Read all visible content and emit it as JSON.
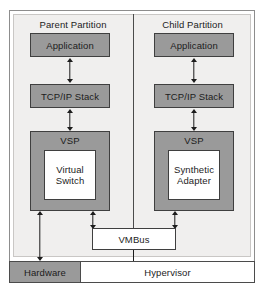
{
  "diagram": {
    "type": "block-diagram",
    "colors": {
      "component_fill": "#9a9a9a",
      "component_border": "#3f3f3f",
      "inner_fill": "#ffffff",
      "panel_background": "#f0efee",
      "frame_border": "#8d8d8d",
      "connector": "#1c1c1c"
    }
  },
  "partitions": [
    {
      "caption": "Parent Partition",
      "components": [
        {
          "label": "Application",
          "style": "gray"
        },
        {
          "label": "TCP/IP Stack",
          "style": "gray"
        },
        {
          "label": "VSP",
          "style": "gray",
          "inner": {
            "label": "Virtual\nSwitch",
            "line1": "Virtual",
            "line2": "Switch",
            "style": "white"
          }
        }
      ]
    },
    {
      "caption": "Child Partition",
      "components": [
        {
          "label": "Application",
          "style": "gray"
        },
        {
          "label": "TCP/IP Stack",
          "style": "gray"
        },
        {
          "label": "VSP",
          "style": "gray",
          "inner": {
            "label": "Synthetic\nAdapter",
            "line1": "Synthetic",
            "line2": "Adapter",
            "style": "white"
          }
        }
      ]
    }
  ],
  "bus": {
    "label": "VMBus",
    "style": "white"
  },
  "platform": [
    {
      "label": "Hardware",
      "style": "gray"
    },
    {
      "label": "Hypervisor",
      "style": "white"
    }
  ],
  "connectors": [
    {
      "from": "Parent Application",
      "to": "Parent TCP/IP Stack",
      "arrows": "both"
    },
    {
      "from": "Parent TCP/IP Stack",
      "to": "Parent VSP",
      "arrows": "both"
    },
    {
      "from": "Parent VSP",
      "to": "Hardware",
      "arrows": "both"
    },
    {
      "from": "Parent VSP",
      "to": "VMBus",
      "arrows": "both"
    },
    {
      "from": "Child Application",
      "to": "Child TCP/IP Stack",
      "arrows": "both"
    },
    {
      "from": "Child TCP/IP Stack",
      "to": "Child VSP",
      "arrows": "both"
    },
    {
      "from": "Child VSP",
      "to": "VMBus",
      "arrows": "both"
    },
    {
      "from": "VMBus",
      "to": "Hypervisor",
      "arrows": "none"
    }
  ]
}
